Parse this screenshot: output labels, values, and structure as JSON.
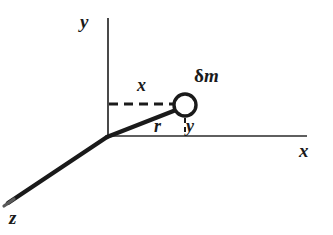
{
  "figure": {
    "type": "diagram",
    "width": 333,
    "height": 235,
    "background_color": "#ffffff",
    "ink_color": "#1a1a1a"
  },
  "axes": {
    "y": {
      "label": "y",
      "kind": "vertical-axis",
      "from": [
        108,
        18
      ],
      "to": [
        108,
        137
      ],
      "stroke_width": 1.6
    },
    "x": {
      "label": "x",
      "kind": "horizontal-axis",
      "from": [
        108,
        136
      ],
      "to": [
        307,
        136
      ],
      "stroke_width": 1.6
    },
    "z": {
      "label": "z",
      "kind": "oblique-axis",
      "from": [
        107,
        137
      ],
      "to": [
        5,
        205
      ],
      "stroke_width": 4.2
    }
  },
  "mass_element": {
    "label_delta": "δ",
    "label_m": "m",
    "label_full": "δm",
    "center": [
      185,
      105
    ],
    "radius": 11,
    "stroke_width": 3.4,
    "fill": "#ffffff"
  },
  "position_vector": {
    "label": "r",
    "kind": "radius-line",
    "from": [
      107,
      137
    ],
    "to": [
      176,
      110
    ],
    "stroke_width": 4.2
  },
  "projections": {
    "x_projection": {
      "label": "x",
      "kind": "horizontal-dashed-guide",
      "from": [
        109,
        104
      ],
      "to": [
        172,
        104
      ],
      "dash": "9 6",
      "stroke_width": 2.6
    },
    "y_projection": {
      "label": "y",
      "kind": "vertical-dashed-guide",
      "from": [
        185,
        118
      ],
      "to": [
        185,
        136
      ],
      "dash": "5 4",
      "stroke_width": 2.0
    }
  }
}
